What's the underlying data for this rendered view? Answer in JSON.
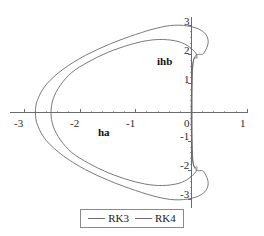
{
  "chart_data": {
    "type": "line",
    "title": "",
    "xlabel": "ha",
    "ylabel": "ihb",
    "xlim": [
      -3.25,
      1.0
    ],
    "ylim": [
      -3.3,
      3.3
    ],
    "grid": false,
    "legend_position": "bottom-center",
    "x_ticks": [
      "-3",
      "-2",
      "-1",
      "0",
      "1"
    ],
    "x_tick_values": [
      -3,
      -2,
      -1,
      0,
      1
    ],
    "y_ticks": [
      "3",
      "2",
      "1",
      "-1",
      "-2",
      "-3"
    ],
    "y_tick_values": [
      3,
      2,
      1,
      -1,
      -2,
      -3
    ],
    "minor_ticks_per_interval": 4,
    "series": [
      {
        "name": "RK3",
        "color": "#6b6b6b",
        "closed": true,
        "points": [
          [
            0.02,
            1.55
          ],
          [
            0.1,
            1.9
          ],
          [
            0.02,
            2.18
          ],
          [
            -0.18,
            2.42
          ],
          [
            -0.45,
            2.52
          ],
          [
            -0.75,
            2.5
          ],
          [
            -1.1,
            2.35
          ],
          [
            -1.5,
            2.08
          ],
          [
            -1.85,
            1.75
          ],
          [
            -2.15,
            1.38
          ],
          [
            -2.35,
            0.95
          ],
          [
            -2.48,
            0.48
          ],
          [
            -2.52,
            0.0
          ],
          [
            -2.48,
            -0.48
          ],
          [
            -2.35,
            -0.95
          ],
          [
            -2.15,
            -1.38
          ],
          [
            -1.85,
            -1.75
          ],
          [
            -1.5,
            -2.08
          ],
          [
            -1.1,
            -2.35
          ],
          [
            -0.75,
            -2.5
          ],
          [
            -0.45,
            -2.52
          ],
          [
            -0.18,
            -2.42
          ],
          [
            0.02,
            -2.18
          ],
          [
            0.1,
            -1.9
          ],
          [
            0.02,
            -1.55
          ]
        ]
      },
      {
        "name": "RK4",
        "color": "#6b6b6b",
        "closed": true,
        "points": [
          [
            0.02,
            1.62
          ],
          [
            0.22,
            2.05
          ],
          [
            0.3,
            2.45
          ],
          [
            0.22,
            2.78
          ],
          [
            0.0,
            2.97
          ],
          [
            -0.3,
            3.02
          ],
          [
            -0.62,
            2.92
          ],
          [
            -1.0,
            2.7
          ],
          [
            -1.45,
            2.38
          ],
          [
            -1.9,
            1.98
          ],
          [
            -2.3,
            1.5
          ],
          [
            -2.6,
            0.98
          ],
          [
            -2.76,
            0.45
          ],
          [
            -2.8,
            0.0
          ],
          [
            -2.76,
            -0.45
          ],
          [
            -2.6,
            -0.98
          ],
          [
            -2.3,
            -1.5
          ],
          [
            -1.9,
            -1.98
          ],
          [
            -1.45,
            -2.38
          ],
          [
            -1.0,
            -2.7
          ],
          [
            -0.62,
            -2.92
          ],
          [
            -0.3,
            -3.02
          ],
          [
            0.0,
            -2.97
          ],
          [
            0.22,
            -2.78
          ],
          [
            0.3,
            -2.45
          ],
          [
            0.22,
            -2.05
          ],
          [
            0.02,
            -1.62
          ]
        ]
      }
    ],
    "legend": [
      {
        "label": "RK3",
        "color": "#6b6b6b"
      },
      {
        "label": "RK4",
        "color": "#6b6b6b"
      }
    ],
    "axis_color": "#6b6b6b",
    "background": "#ffffff"
  },
  "axes": {
    "x_name": "ha",
    "y_name": "ihb"
  },
  "tick_text": {
    "x_neg3": "-3",
    "x_neg2": "-2",
    "x_neg1": "-1",
    "x_zero": "0",
    "x_pos1": "1",
    "y_pos3": "3",
    "y_pos2": "2",
    "y_pos1": "1",
    "y_neg1": "-1",
    "y_neg2": "-2",
    "y_neg3": "-3"
  },
  "legend": {
    "rk3_label": "RK3",
    "rk4_label": "RK4"
  }
}
